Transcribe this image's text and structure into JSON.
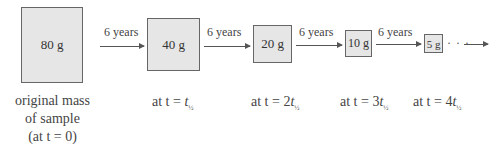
{
  "boxes": [
    {
      "label": "80 g"
    },
    {
      "label": "40 g"
    },
    {
      "label": "20 g"
    },
    {
      "label": "10 g"
    },
    {
      "label": "5 g"
    }
  ],
  "arrows": [
    {
      "label": "6 years"
    },
    {
      "label": "6 years"
    },
    {
      "label": "6 years"
    },
    {
      "label": "6 years"
    },
    {
      "label": "6 years"
    }
  ],
  "continuation": "· · ·",
  "captions": {
    "original": {
      "line1": "original mass",
      "line2": "of sample",
      "line3": "(at t = 0)"
    },
    "c1": {
      "prefix": "at t = ",
      "coef": "",
      "var": "t",
      "sub": "½"
    },
    "c2": {
      "prefix": "at t = ",
      "coef": "2",
      "var": "t",
      "sub": "½"
    },
    "c3": {
      "prefix": "at t = ",
      "coef": "3",
      "var": "t",
      "sub": "½"
    },
    "c4": {
      "prefix": "at t = ",
      "coef": "4",
      "var": "t",
      "sub": "½"
    }
  }
}
